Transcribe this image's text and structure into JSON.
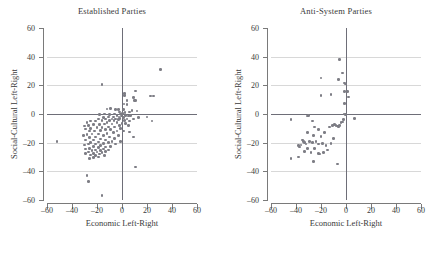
{
  "figure": {
    "axis_label_x": "Economic Left-Right",
    "axis_label_y": "Social-Cultural Left-Right",
    "point_color": "#7d7d85",
    "gridline_color": "#d8d8d8",
    "axisline_color": "#6e6e78",
    "tick_values": [
      -60,
      -40,
      -20,
      0,
      20,
      40,
      60
    ],
    "tick_labels": [
      "–60",
      "–40",
      "–20",
      "0",
      "20",
      "40",
      "60"
    ]
  },
  "chart_data": [
    {
      "type": "scatter",
      "title": "Established Parties",
      "xlabel": "Economic Left-Right",
      "ylabel": "Social-Cultural Left-Right",
      "xlim": [
        -60,
        60
      ],
      "ylim": [
        -60,
        60
      ],
      "xticks": [
        -60,
        -40,
        -20,
        0,
        20,
        40,
        60
      ],
      "yticks": [
        -60,
        -40,
        -20,
        0,
        20,
        40,
        60
      ],
      "grid": true,
      "legend": null,
      "marker_color": "#7d7d85",
      "points": [
        [
          31,
          31
        ],
        [
          -16,
          20.5
        ],
        [
          11,
          16
        ],
        [
          2,
          14.5
        ],
        [
          23,
          12.5
        ],
        [
          25,
          12.5
        ],
        [
          2,
          13
        ],
        [
          9,
          11.5
        ],
        [
          10,
          9.5
        ],
        [
          4,
          9.5
        ],
        [
          11,
          9.5
        ],
        [
          1.5,
          7
        ],
        [
          4,
          6.5
        ],
        [
          -9,
          4
        ],
        [
          -12,
          3.5
        ],
        [
          -5,
          3
        ],
        [
          -3,
          3
        ],
        [
          1,
          3
        ],
        [
          8,
          2.5
        ],
        [
          12,
          2
        ],
        [
          6,
          1.5
        ],
        [
          -2,
          1.5
        ],
        [
          2.5,
          1
        ],
        [
          0.5,
          0.5
        ],
        [
          -1,
          0
        ],
        [
          -6,
          0
        ],
        [
          -14,
          0
        ],
        [
          -18,
          -0.5
        ],
        [
          -10,
          -0.5
        ],
        [
          -4,
          -1
        ],
        [
          3,
          -1
        ],
        [
          7,
          -1
        ],
        [
          5,
          -1.5
        ],
        [
          -0.5,
          -1.5
        ],
        [
          -2.5,
          -2
        ],
        [
          -7,
          -2
        ],
        [
          -11,
          -2
        ],
        [
          -15,
          -2.5
        ],
        [
          13,
          -2.5
        ],
        [
          20,
          -2
        ],
        [
          1,
          -2.5
        ],
        [
          -1.5,
          -3
        ],
        [
          -5,
          -3.5
        ],
        [
          -8,
          -3.5
        ],
        [
          -13,
          -3.5
        ],
        [
          -19,
          -3.5
        ],
        [
          4,
          -3.5
        ],
        [
          9,
          -3.5
        ],
        [
          -3,
          -4
        ],
        [
          -6.5,
          -4.5
        ],
        [
          -10,
          -4.5
        ],
        [
          -16,
          -4.5
        ],
        [
          2,
          -4.5
        ],
        [
          6,
          -5
        ],
        [
          24,
          -5
        ],
        [
          -21,
          -5
        ],
        [
          -25,
          -5
        ],
        [
          -28,
          -6
        ],
        [
          -12,
          -6
        ],
        [
          -4,
          -6
        ],
        [
          0,
          -6.5
        ],
        [
          3,
          -6.5
        ],
        [
          -8,
          -7
        ],
        [
          -14,
          -7
        ],
        [
          -18,
          -7.5
        ],
        [
          -23,
          -7.5
        ],
        [
          -27,
          -8
        ],
        [
          -30,
          -8.5
        ],
        [
          -2,
          -8
        ],
        [
          5,
          -8
        ],
        [
          -6,
          -9
        ],
        [
          -11,
          -9
        ],
        [
          -16,
          -9.5
        ],
        [
          -20,
          -9.5
        ],
        [
          -25,
          -10
        ],
        [
          -29,
          -10.5
        ],
        [
          -1,
          -10
        ],
        [
          -9,
          -11
        ],
        [
          -13,
          -11
        ],
        [
          -17,
          -11.5
        ],
        [
          -22,
          -12
        ],
        [
          -26,
          -12
        ],
        [
          -4,
          -12
        ],
        [
          1,
          -12
        ],
        [
          -7,
          -13
        ],
        [
          -12,
          -13.5
        ],
        [
          -19,
          -14
        ],
        [
          -24,
          -14
        ],
        [
          -28,
          -14.5
        ],
        [
          -31,
          -15
        ],
        [
          -15,
          -15
        ],
        [
          -3,
          -15
        ],
        [
          -10,
          -16
        ],
        [
          -21,
          -16
        ],
        [
          -26,
          -16.5
        ],
        [
          -6,
          -17
        ],
        [
          -17,
          -17.5
        ],
        [
          -13,
          -18
        ],
        [
          -23,
          -18
        ],
        [
          -29,
          -18
        ],
        [
          -8,
          -19
        ],
        [
          -52,
          -19
        ],
        [
          -19,
          -19.5
        ],
        [
          -25,
          -20
        ],
        [
          -11,
          -20
        ],
        [
          -15,
          -20.5
        ],
        [
          -21,
          -21
        ],
        [
          -27,
          -21
        ],
        [
          -30,
          -21.5
        ],
        [
          -5,
          -21
        ],
        [
          -17,
          -22
        ],
        [
          -23,
          -22.5
        ],
        [
          -9,
          -22.5
        ],
        [
          -13,
          -23
        ],
        [
          -19,
          -23.5
        ],
        [
          -26,
          -24
        ],
        [
          -29,
          -24.5
        ],
        [
          -15,
          -24.5
        ],
        [
          -11,
          -25
        ],
        [
          -21,
          -25
        ],
        [
          -24,
          -25.5
        ],
        [
          -17,
          -25.5
        ],
        [
          -13,
          -26
        ],
        [
          -27,
          -26.5
        ],
        [
          -20,
          -26.5
        ],
        [
          -16,
          -27
        ],
        [
          -23,
          -27.5
        ],
        [
          -29,
          -27.5
        ],
        [
          -18,
          -28
        ],
        [
          -25,
          -28.5
        ],
        [
          -21,
          -29
        ],
        [
          -14,
          -29
        ],
        [
          -19,
          -30
        ],
        [
          -23,
          -30.5
        ],
        [
          -26,
          -31
        ],
        [
          9,
          -16
        ],
        [
          6,
          -12.5
        ],
        [
          -1,
          -19
        ],
        [
          11,
          -37
        ],
        [
          -28,
          -43
        ],
        [
          -27,
          -47
        ],
        [
          -16,
          -57
        ]
      ]
    },
    {
      "type": "scatter",
      "title": "Anti-System Parties",
      "xlabel": "Economic Left-Right",
      "ylabel": "Social-Cultural Left-Right",
      "xlim": [
        -60,
        60
      ],
      "ylim": [
        -60,
        60
      ],
      "xticks": [
        -60,
        -40,
        -20,
        0,
        20,
        40,
        60
      ],
      "yticks": [
        -60,
        -40,
        -20,
        0,
        20,
        40,
        60
      ],
      "grid": true,
      "legend": null,
      "marker_color": "#7d7d85",
      "points": [
        [
          -5,
          38
        ],
        [
          -3,
          28.5
        ],
        [
          -20,
          25
        ],
        [
          -6,
          24
        ],
        [
          -1,
          21.5
        ],
        [
          -0.5,
          21
        ],
        [
          -12,
          13.5
        ],
        [
          -20,
          13
        ],
        [
          -1,
          15.5
        ],
        [
          1,
          15.5
        ],
        [
          2,
          12
        ],
        [
          -1,
          7.5
        ],
        [
          -1.5,
          0
        ],
        [
          -0.5,
          -0.5
        ],
        [
          7,
          -3
        ],
        [
          -30,
          -1
        ],
        [
          -31,
          -1.5
        ],
        [
          -44,
          -4
        ],
        [
          -27,
          -5
        ],
        [
          -9,
          -7.5
        ],
        [
          -8,
          -8
        ],
        [
          -7,
          -8.5
        ],
        [
          -6,
          -9
        ],
        [
          -5,
          -8
        ],
        [
          -4,
          -6
        ],
        [
          -3,
          -5.5
        ],
        [
          -25,
          -9
        ],
        [
          -22,
          -11
        ],
        [
          -31,
          -13
        ],
        [
          -26,
          -15
        ],
        [
          -20,
          -15.5
        ],
        [
          -17,
          -13
        ],
        [
          -13,
          -9
        ],
        [
          -11,
          -8
        ],
        [
          -35,
          -18
        ],
        [
          -34,
          -19
        ],
        [
          -33,
          -20
        ],
        [
          -32,
          -21
        ],
        [
          -36,
          -21.5
        ],
        [
          -38,
          -22
        ],
        [
          -29,
          -19
        ],
        [
          -27,
          -20
        ],
        [
          -24,
          -19
        ],
        [
          -22,
          -21
        ],
        [
          -19,
          -20.5
        ],
        [
          -12,
          -20.5
        ],
        [
          -37,
          -23
        ],
        [
          -31,
          -24
        ],
        [
          -25,
          -24
        ],
        [
          -33,
          -26
        ],
        [
          -28,
          -27
        ],
        [
          -22,
          -27.5
        ],
        [
          -21,
          -28
        ],
        [
          -18,
          -27
        ],
        [
          -15,
          -25
        ],
        [
          -44,
          -31
        ],
        [
          -38,
          -30
        ],
        [
          -26,
          -33
        ],
        [
          -7,
          -35
        ],
        [
          -2,
          -4
        ],
        [
          -10,
          -17
        ],
        [
          -16,
          -22
        ]
      ]
    }
  ]
}
